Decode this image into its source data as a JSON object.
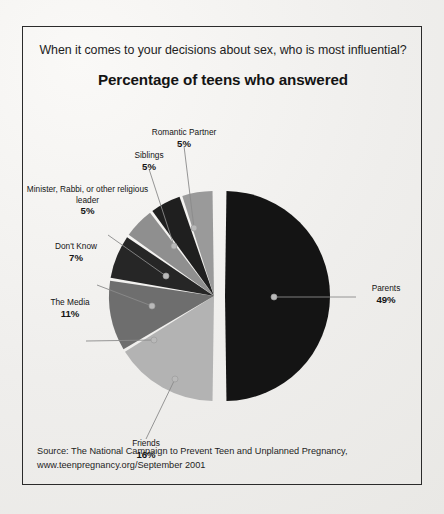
{
  "panel": {
    "question": "When it comes to your decisions about sex, who is most influential?",
    "subtitle": "Percentage of teens who answered"
  },
  "source": {
    "line1": "Source: The National Campaign to Prevent Teen and Unplanned Pregnancy,",
    "line2": "www.teenpregnancy.org/September 2001"
  },
  "colors": {
    "parents": "#141414",
    "romantic_partner": "#9a9a9a",
    "siblings": "#1f1f1f",
    "minister": "#8f8f8f",
    "dont_know": "#262626",
    "the_media": "#6e6e6e",
    "friends": "#b3b3b3",
    "border": "#2b2b2b",
    "background": "#f2f1ef",
    "leader_line": "#8a8a8a",
    "text": "#141414"
  },
  "chart_data": {
    "type": "pie",
    "title": "Percentage of teens who answered",
    "subtitle": "When it comes to your decisions about sex, who is most influential?",
    "unit": "%",
    "legend": "none",
    "labels_inline": true,
    "total": 98,
    "categories": [
      "Parents",
      "Friends",
      "The Media",
      "Don't Know",
      "Minister, Rabbi, or other religious leader",
      "Siblings",
      "Romantic Partner"
    ],
    "values": [
      49,
      16,
      11,
      7,
      5,
      5,
      5
    ],
    "slices": [
      {
        "label": "Parents",
        "value": 49,
        "display": "49%",
        "color": "#141414",
        "exploded": true
      },
      {
        "label": "Friends",
        "value": 16,
        "display": "16%",
        "color": "#b3b3b3",
        "exploded": false
      },
      {
        "label": "The Media",
        "value": 11,
        "display": "11%",
        "color": "#6e6e6e",
        "exploded": false
      },
      {
        "label": "Don't Know",
        "value": 7,
        "display": "7%",
        "color": "#262626",
        "exploded": false
      },
      {
        "label": "Minister, Rabbi, or other religious leader",
        "value": 5,
        "display": "5%",
        "color": "#8f8f8f",
        "exploded": false
      },
      {
        "label": "Siblings",
        "value": 5,
        "display": "5%",
        "color": "#1f1f1f",
        "exploded": false
      },
      {
        "label": "Romantic Partner",
        "value": 5,
        "display": "5%",
        "color": "#9a9a9a",
        "exploded": false
      }
    ]
  },
  "labels": {
    "romantic_partner": {
      "name": "Romantic Partner",
      "pct": "5%"
    },
    "siblings": {
      "name": "Siblings",
      "pct": "5%"
    },
    "minister_line1": "Minister, Rabbi, or",
    "minister_line2": "other religious leader",
    "minister_pct": "5%",
    "dont_know": {
      "name": "Don't Know",
      "pct": "7%"
    },
    "the_media": {
      "name": "The Media",
      "pct": "11%"
    },
    "friends": {
      "name": "Friends",
      "pct": "16%"
    },
    "parents": {
      "name": "Parents",
      "pct": "49%"
    }
  }
}
